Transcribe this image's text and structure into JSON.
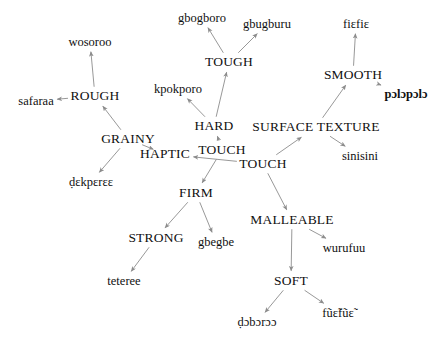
{
  "graph": {
    "title": "Haptic / surface-texture semantic network",
    "edge_color": "#8c8c8c",
    "text_color": "#101010",
    "background": "#ffffff",
    "nodes": [
      {
        "id": "wosoroo",
        "label": "wosoroo",
        "kind": "term",
        "x": 90,
        "y": 42
      },
      {
        "id": "gbogboro",
        "label": "gbogboro",
        "kind": "term",
        "x": 202,
        "y": 18
      },
      {
        "id": "gbugburu",
        "label": "gbugburu",
        "kind": "term",
        "x": 267,
        "y": 24
      },
      {
        "id": "fiefie",
        "label": "fiɛfiɛ",
        "kind": "term",
        "x": 356,
        "y": 24
      },
      {
        "id": "tough",
        "label": "TOUGH",
        "kind": "concept",
        "x": 229,
        "y": 62
      },
      {
        "id": "smooth",
        "label": "SMOOTH",
        "kind": "concept",
        "x": 353,
        "y": 75
      },
      {
        "id": "rough",
        "label": "ROUGH",
        "kind": "concept",
        "x": 95,
        "y": 96
      },
      {
        "id": "kpokporo",
        "label": "kpokporo",
        "kind": "term",
        "x": 178,
        "y": 89
      },
      {
        "id": "safaraa",
        "label": "safaraa",
        "kind": "term",
        "x": 36,
        "y": 101
      },
      {
        "id": "polopolo",
        "label": "pɔlɔpɔlɔ",
        "kind": "term-bold",
        "x": 406,
        "y": 94
      },
      {
        "id": "hard",
        "label": "HARD",
        "kind": "concept",
        "x": 214,
        "y": 126
      },
      {
        "id": "surface_texture",
        "label": "SURFACE TEXTURE",
        "kind": "concept",
        "x": 316,
        "y": 127
      },
      {
        "id": "grainy",
        "label": "GRAINY",
        "kind": "concept",
        "x": 128,
        "y": 139
      },
      {
        "id": "touch_center",
        "label": "TOUCH",
        "kind": "concept",
        "x": 222,
        "y": 150
      },
      {
        "id": "haptic",
        "label": "HAPTIC",
        "kind": "concept",
        "x": 165,
        "y": 154
      },
      {
        "id": "sinisini",
        "label": "sinisini",
        "kind": "term",
        "x": 360,
        "y": 156
      },
      {
        "id": "touch_lower",
        "label": "TOUCH",
        "kind": "concept",
        "x": 263,
        "y": 164
      },
      {
        "id": "dekperee",
        "label": "ḍɛkpɛrɛɛ",
        "kind": "term",
        "x": 91,
        "y": 182
      },
      {
        "id": "firm",
        "label": "FIRM",
        "kind": "concept",
        "x": 196,
        "y": 193
      },
      {
        "id": "malleable",
        "label": "MALLEABLE",
        "kind": "concept",
        "x": 292,
        "y": 220
      },
      {
        "id": "strong",
        "label": "STRONG",
        "kind": "concept",
        "x": 156,
        "y": 238
      },
      {
        "id": "gbegbe",
        "label": "gbegbe",
        "kind": "term",
        "x": 216,
        "y": 242
      },
      {
        "id": "wurufuu",
        "label": "wurufuu",
        "kind": "term",
        "x": 344,
        "y": 248
      },
      {
        "id": "soft",
        "label": "SOFT",
        "kind": "concept",
        "x": 291,
        "y": 281
      },
      {
        "id": "teteree",
        "label": "teteree",
        "kind": "term",
        "x": 124,
        "y": 281
      },
      {
        "id": "fuefue",
        "label": "fũɛ̃fũɛ̃",
        "kind": "term",
        "x": 338,
        "y": 313
      },
      {
        "id": "doboroo",
        "label": "ḍɔbɔrɔɔ",
        "kind": "term",
        "x": 257,
        "y": 322
      }
    ],
    "edges": [
      {
        "from": "rough",
        "to": "wosoroo"
      },
      {
        "from": "rough",
        "to": "safaraa"
      },
      {
        "from": "grainy",
        "to": "rough"
      },
      {
        "from": "grainy",
        "to": "dekperee"
      },
      {
        "from": "haptic",
        "to": "grainy"
      },
      {
        "from": "touch_lower",
        "to": "haptic"
      },
      {
        "from": "touch_center",
        "to": "hard"
      },
      {
        "from": "hard",
        "to": "kpokporo"
      },
      {
        "from": "hard",
        "to": "tough"
      },
      {
        "from": "tough",
        "to": "gbogboro"
      },
      {
        "from": "tough",
        "to": "gbugburu"
      },
      {
        "from": "touch_center",
        "to": "firm"
      },
      {
        "from": "firm",
        "to": "strong"
      },
      {
        "from": "firm",
        "to": "gbegbe"
      },
      {
        "from": "strong",
        "to": "teteree"
      },
      {
        "from": "touch_lower",
        "to": "surface_texture"
      },
      {
        "from": "surface_texture",
        "to": "smooth"
      },
      {
        "from": "surface_texture",
        "to": "sinisini"
      },
      {
        "from": "smooth",
        "to": "fiefie"
      },
      {
        "from": "smooth",
        "to": "polopolo"
      },
      {
        "from": "touch_lower",
        "to": "malleable"
      },
      {
        "from": "malleable",
        "to": "wurufuu"
      },
      {
        "from": "malleable",
        "to": "soft"
      },
      {
        "from": "soft",
        "to": "doboroo"
      },
      {
        "from": "soft",
        "to": "fuefue"
      }
    ]
  }
}
